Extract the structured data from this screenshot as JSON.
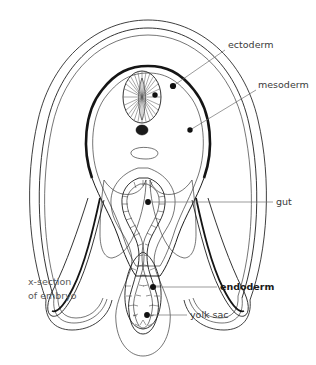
{
  "figure": {
    "title": "x-section of embryo",
    "caption_line1": "x-section",
    "caption_line2": "of embryo",
    "type": "biological-diagram"
  },
  "labels": [
    {
      "id": "ectoderm",
      "text": "ectoderm",
      "bold": false,
      "x": 228,
      "y": 48,
      "leader": {
        "from_x": 225,
        "from_y": 50,
        "to_x": 173,
        "to_y": 86
      },
      "marker": {
        "x": 173,
        "y": 86
      }
    },
    {
      "id": "mesoderm",
      "text": "mesoderm",
      "bold": false,
      "x": 258,
      "y": 88,
      "leader": {
        "from_x": 256,
        "from_y": 90,
        "to_x": 190,
        "to_y": 130
      },
      "marker": {
        "x": 190,
        "y": 130
      }
    },
    {
      "id": "gut",
      "text": "gut",
      "bold": false,
      "x": 276,
      "y": 205,
      "leader": {
        "from_x": 273,
        "from_y": 202,
        "to_x": 148,
        "to_y": 202
      },
      "marker": {
        "x": 148,
        "y": 202
      }
    },
    {
      "id": "endoderm",
      "text": "endoderm",
      "bold": true,
      "x": 220,
      "y": 290,
      "leader": {
        "from_x": 217,
        "from_y": 287,
        "to_x": 153,
        "to_y": 287
      },
      "marker": {
        "x": 153,
        "y": 287
      }
    },
    {
      "id": "yolk-sac",
      "text": "yolk sac",
      "bold": false,
      "x": 190,
      "y": 318,
      "leader": {
        "from_x": 187,
        "from_y": 315,
        "to_x": 147,
        "to_y": 315
      },
      "marker": {
        "x": 147,
        "y": 315
      }
    }
  ],
  "structures": [
    {
      "id": "amnion",
      "name": "amnion"
    },
    {
      "id": "ectoderm-layer",
      "name": "ectoderm layer"
    },
    {
      "id": "mesoderm-layer",
      "name": "mesoderm layer"
    },
    {
      "id": "neural-tube",
      "name": "neural tube"
    },
    {
      "id": "notochord",
      "name": "notochord"
    },
    {
      "id": "dorsal-aorta",
      "name": "dorsal aorta"
    },
    {
      "id": "gut-tube",
      "name": "gut tube"
    },
    {
      "id": "yolk-sac-body",
      "name": "yolk sac"
    },
    {
      "id": "lateral-fold-left",
      "name": "left lateral body fold"
    },
    {
      "id": "lateral-fold-right",
      "name": "right lateral body fold"
    }
  ],
  "colors": {
    "ink": "#1d1d1d",
    "leader": "#707070",
    "label": "#3a3a3a",
    "label_gray": "#5a5a5a",
    "stipple": "#e9e9e9",
    "hatch": "#8d8d8d",
    "background": "#ffffff"
  }
}
